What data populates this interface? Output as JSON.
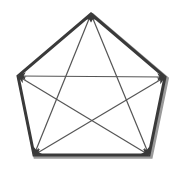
{
  "figure": {
    "background_color": "#ffffff",
    "outline_color": "#3a3a3a",
    "outline_shadow_color": "#9a9a9a",
    "diagonal_color": "#555555",
    "arrowhead_color": "#3a3a3a",
    "outline_width": 3,
    "outline_shadow_width": 2,
    "diagonal_width": 1.2
  },
  "chart_data": {
    "type": "diagram",
    "shape": "pentagon",
    "vertex_count": 5,
    "diagonal_count": 5,
    "vertices": [
      {
        "id": "top",
        "label": "T",
        "x": 91,
        "y": 14
      },
      {
        "id": "right",
        "label": "R",
        "x": 165,
        "y": 77
      },
      {
        "id": "bottom-right",
        "label": "BR",
        "x": 149,
        "y": 155
      },
      {
        "id": "bottom-left",
        "label": "BL",
        "x": 34,
        "y": 155
      },
      {
        "id": "left",
        "label": "L",
        "x": 18,
        "y": 76
      }
    ],
    "edges": [
      {
        "from": "top",
        "to": "right"
      },
      {
        "from": "right",
        "to": "bottom-right"
      },
      {
        "from": "bottom-right",
        "to": "bottom-left"
      },
      {
        "from": "bottom-left",
        "to": "left"
      },
      {
        "from": "left",
        "to": "top"
      }
    ],
    "diagonals": [
      {
        "id": "diag-left-right",
        "from": "left",
        "to": "right",
        "arrows": "both"
      },
      {
        "id": "diag-top-bottomleft",
        "from": "top",
        "to": "bottom-left",
        "arrows": "both"
      },
      {
        "id": "diag-top-bottomright",
        "from": "top",
        "to": "bottom-right",
        "arrows": "both"
      },
      {
        "id": "diag-left-bottomright",
        "from": "left",
        "to": "bottom-right",
        "arrows": "both"
      },
      {
        "id": "diag-right-bottomleft",
        "from": "right",
        "to": "bottom-left",
        "arrows": "both"
      }
    ],
    "xlim": [
      0,
      181
    ],
    "ylim": [
      0,
      169
    ],
    "grid": false,
    "legend": false
  }
}
